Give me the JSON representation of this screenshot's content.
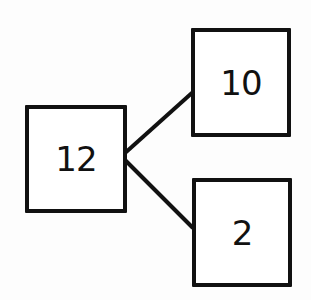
{
  "diagram": {
    "type": "number-bond",
    "whole": {
      "label": "12"
    },
    "parts": [
      {
        "label": "10"
      },
      {
        "label": "2"
      }
    ],
    "colors": {
      "stroke": "#111111",
      "background": "#ffffff"
    }
  }
}
